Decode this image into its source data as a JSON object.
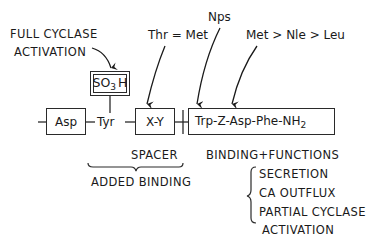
{
  "diagram": {
    "annotations": {
      "full_cyclase_line1": "FULL CYCLASE",
      "full_cyclase_line2": "ACTIVATION",
      "thr_met": "Thr = Met",
      "nps": "Nps",
      "met_nle_leu": "Met > Nle > Leu"
    },
    "modifier": {
      "so3h_main": "SO",
      "so3h_sub": "3",
      "so3h_tail": "H"
    },
    "chain": {
      "asp": "Asp",
      "tyr": "Tyr",
      "xy": "X-Y",
      "trp_segment_main": "Trp-Z-Asp-Phe-NH",
      "trp_segment_sub": "2"
    },
    "labels": {
      "spacer": "SPACER",
      "added_binding": "ADDED BINDING",
      "binding_functions": "BINDING+FUNCTIONS",
      "functions": [
        "SECRETION",
        "CA OUTFLUX",
        "PARTIAL CYCLASE",
        "ACTIVATION"
      ]
    }
  }
}
